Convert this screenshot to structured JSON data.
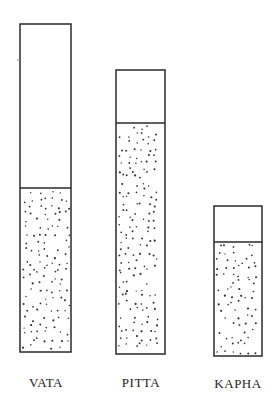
{
  "diagram": {
    "type": "stippled-column-containers",
    "columns": [
      {
        "name": "VATA",
        "label": "VATA",
        "box": {
          "x": 20,
          "top": 24,
          "divider": 188,
          "bottom": 352,
          "width": 51
        },
        "filled_fraction": 0.5
      },
      {
        "name": "PITTA",
        "label": "PITTA",
        "box": {
          "x": 116,
          "top": 70,
          "divider": 123,
          "bottom": 354,
          "width": 49
        },
        "filled_fraction": 0.81
      },
      {
        "name": "KAPHA",
        "label": "KAPHA",
        "box": {
          "x": 214,
          "top": 206,
          "divider": 242,
          "bottom": 356,
          "width": 48
        },
        "filled_fraction": 0.76
      }
    ],
    "colors": {
      "outline": "#2a2a2a",
      "stipple": "#333333",
      "background": "#ffffff"
    }
  }
}
